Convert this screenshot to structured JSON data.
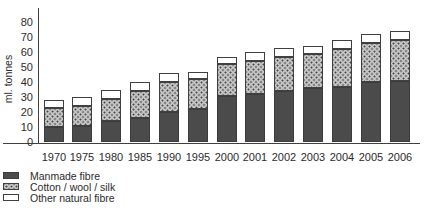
{
  "chart_data": {
    "type": "bar",
    "stacked": true,
    "title": "",
    "xlabel": "",
    "ylabel": "ml. tonnes",
    "ylim": [
      0,
      80
    ],
    "yticks": [
      0,
      10,
      20,
      30,
      40,
      50,
      60,
      70,
      80
    ],
    "grid": false,
    "legend_position": "bottom-left",
    "categories": [
      "1970",
      "1975",
      "1980",
      "1985",
      "1990",
      "1995",
      "2000",
      "2001",
      "2002",
      "2003",
      "2004",
      "2005",
      "2006"
    ],
    "series": [
      {
        "name": "Manmade fibre",
        "style": "solid",
        "values": [
          10,
          11,
          14,
          16,
          20,
          22,
          31,
          32,
          34,
          36,
          37,
          40,
          41
        ]
      },
      {
        "name": "Cotton / wool / silk",
        "style": "dots",
        "values": [
          13,
          13,
          15,
          18,
          20,
          20,
          21,
          22,
          23,
          23,
          25,
          26,
          27
        ]
      },
      {
        "name": "Other natural fibre",
        "style": "white",
        "values": [
          5,
          6,
          6,
          6,
          6,
          5,
          5,
          6,
          6,
          5,
          6,
          6,
          6
        ]
      }
    ],
    "totals": [
      28,
      30,
      35,
      40,
      46,
      47,
      57,
      60,
      63,
      64,
      68,
      72,
      74
    ]
  },
  "colors": {
    "background": "#ffffff",
    "axis": "#404040",
    "text": "#2b2b2b",
    "manmade_fill": "#4b4b4b",
    "cotton_fill": "#c9c9c9",
    "cotton_dot": "#474747",
    "other_fill": "#ffffff",
    "segment_border": "#404040"
  }
}
